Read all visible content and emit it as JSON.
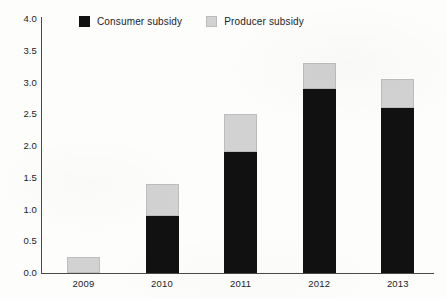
{
  "chart_data": {
    "type": "bar",
    "subtype": "stacked-vertical",
    "title": "",
    "subtitle": "",
    "xlabel": "",
    "ylabel": "",
    "categories": [
      "2009",
      "2010",
      "2011",
      "2012",
      "2013"
    ],
    "series": [
      {
        "name": "Consumer subsidy",
        "color": "#111111",
        "values": [
          0.0,
          0.9,
          1.9,
          2.9,
          2.6
        ]
      },
      {
        "name": "Producer subsidy",
        "color": "#d2d2d2",
        "values": [
          0.25,
          0.5,
          0.6,
          0.4,
          0.45
        ]
      }
    ],
    "totals": [
      0.25,
      1.4,
      2.5,
      3.3,
      3.05
    ],
    "ylim": [
      0.0,
      4.0
    ],
    "ytick_step": 0.5,
    "ytick_labels": [
      "4.0",
      "3.5",
      "3.0",
      "2.5",
      "2.0",
      "1.5",
      "1.0",
      "0.5",
      "0.0"
    ],
    "ytick_values": [
      4.0,
      3.5,
      3.0,
      2.5,
      2.0,
      1.5,
      1.0,
      0.5,
      0.0
    ],
    "xtick_labels": [
      "2009",
      "2010",
      "2011",
      "2012",
      "2013"
    ],
    "grid": false,
    "legend_position": "top-inside"
  },
  "legend": {
    "items": [
      {
        "label": "Consumer subsidy",
        "swatch": "consumer",
        "color": "#111111"
      },
      {
        "label": "Producer subsidy",
        "swatch": "producer",
        "color": "#d2d2d2"
      }
    ]
  },
  "colors": {
    "consumer": "#111111",
    "producer": "#d2d2d2",
    "axis": "#4a4a4a",
    "text": "#1c1c1c",
    "background": "#fdfdfc"
  }
}
